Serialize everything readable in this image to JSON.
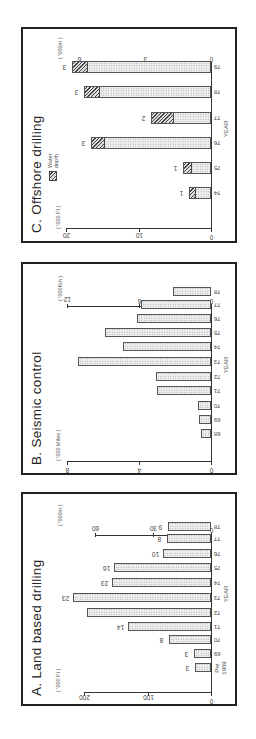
{
  "chart_data": [
    {
      "type": "bar",
      "title": "A.  Land based drilling",
      "xlabel": "YEAR",
      "ylabel_left": "('000 Ft)",
      "ylabel_right": "('000m)",
      "left_ticks": [
        "0",
        "100",
        "200"
      ],
      "right_ticks": [
        "0",
        "30",
        "60"
      ],
      "ylim_left": [
        0,
        200
      ],
      "ylim_right": [
        0,
        60
      ],
      "grid": false,
      "categories": [
        "Pre 1969",
        "69",
        "70",
        "71",
        "72",
        "73",
        "74",
        "75",
        "76",
        "77",
        "78"
      ],
      "values": [
        25,
        27,
        66,
        131,
        196,
        218,
        156,
        153,
        76,
        69,
        68
      ],
      "bar_labels": [
        "3",
        "3",
        "8",
        "14",
        "",
        "23",
        "23",
        "16",
        "10",
        "8",
        "9"
      ]
    },
    {
      "type": "bar",
      "title": "B.  Seismic control",
      "xlabel": "YEAR",
      "ylabel_left": "('000 Miles)",
      "ylabel_right": "('000Km)",
      "left_ticks": [
        "0",
        "4",
        "8"
      ],
      "right_ticks": [
        "0",
        "6",
        "12"
      ],
      "ylim_left": [
        0,
        8
      ],
      "ylim_right": [
        0,
        12
      ],
      "grid": false,
      "categories": [
        "68",
        "69",
        "70",
        "71",
        "72",
        "73",
        "74",
        "75",
        "76",
        "77",
        "78"
      ],
      "values": [
        0.55,
        0.65,
        0.75,
        3.0,
        3.05,
        7.4,
        4.9,
        5.9,
        4.1,
        3.9,
        2.1
      ]
    },
    {
      "type": "bar",
      "stacked": true,
      "title": "C.  Offshore drilling",
      "xlabel": "YEAR",
      "ylabel_left": "('000 Ft)",
      "ylabel_right": "('000m)",
      "left_ticks": [
        "0",
        "10",
        "20"
      ],
      "right_ticks": [
        "0",
        "3",
        "6"
      ],
      "ylim_left": [
        0,
        20
      ],
      "ylim_right": [
        0,
        6
      ],
      "grid": false,
      "legend": [
        "Water depth"
      ],
      "categories": [
        "74",
        "75",
        "76",
        "77",
        "78",
        "79"
      ],
      "series": [
        {
          "name": "Total depth",
          "values": [
            3.0,
            3.9,
            16.6,
            8.3,
            17.5,
            19.2
          ]
        },
        {
          "name": "Water depth",
          "values": [
            0.8,
            1.1,
            1.8,
            3.0,
            2.0,
            2.1
          ]
        }
      ],
      "bar_labels": [
        "1",
        "1",
        "3",
        "2",
        "3",
        "3"
      ]
    }
  ],
  "panels": {
    "a": {
      "title": "A.  Land based drilling",
      "unit_left": "( '000 Ft )",
      "unit_right": "( '000m )",
      "left_ticks": [
        "200",
        "100",
        "0"
      ],
      "right_ticks": [
        "60",
        "30",
        "0"
      ],
      "xlabel": "YEAR",
      "cats": [
        "Pre\n1969",
        "69",
        "70",
        "71",
        "72",
        "73",
        "74",
        "75",
        "76",
        "77",
        "78"
      ],
      "labels": [
        "3",
        "3",
        "8",
        "14",
        "",
        "23",
        "23",
        "16",
        "10",
        "8",
        "9"
      ]
    },
    "b": {
      "title": "B.  Seismic control",
      "unit_left": "( '000 Miles )",
      "unit_right": "( '000Km )",
      "left_ticks": [
        "8",
        "4",
        "0"
      ],
      "right_ticks": [
        "12",
        "6",
        "0"
      ],
      "xlabel": "YEAR",
      "cats": [
        "68",
        "69",
        "70",
        "71",
        "72",
        "73",
        "74",
        "75",
        "76",
        "77",
        "78"
      ]
    },
    "c": {
      "title": "C.  Offshore drilling",
      "unit_left": "( '000 Ft )",
      "unit_right": "( '000m )",
      "left_ticks": [
        "20",
        "10",
        "0"
      ],
      "right_ticks": [
        "6",
        "3",
        "0"
      ],
      "xlabel": "YEAR",
      "legend_label": "Water depth",
      "cats": [
        "74",
        "75",
        "76",
        "77",
        "78",
        "79"
      ],
      "labels": [
        "1",
        "1",
        "3",
        "2",
        "3",
        "3"
      ]
    }
  }
}
